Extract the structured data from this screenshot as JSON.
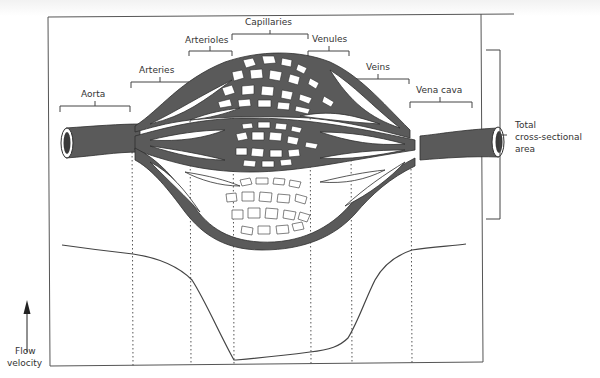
{
  "figure": {
    "segments": [
      {
        "id": "aorta",
        "label": "Aorta"
      },
      {
        "id": "arteries",
        "label": "Arteries"
      },
      {
        "id": "arterioles",
        "label": "Arterioles"
      },
      {
        "id": "capillaries",
        "label": "Capillaries"
      },
      {
        "id": "venules",
        "label": "Venules"
      },
      {
        "id": "veins",
        "label": "Veins"
      },
      {
        "id": "vena-cava",
        "label": "Vena cava"
      }
    ],
    "right_bracket": {
      "line1": "Total",
      "line2": "cross-sectional",
      "line3": "area"
    },
    "y_axis": {
      "line1": "Flow",
      "line2": "velocity",
      "arrow": "up-arrow-icon"
    },
    "colors": {
      "vessel": "#5a5a5a",
      "vessel_outline": "#2e2e2e",
      "lumen": "#ffffff",
      "line": "#444444",
      "frame": "#555555"
    }
  },
  "velocity_curve": {
    "description": "Flow velocity high in aorta, falls through arteries and arterioles, minimal in capillaries, rises through venules and veins back to high in vena cava",
    "relative_values": [
      {
        "segment": "Aorta",
        "value": 0.92
      },
      {
        "segment": "Arteries",
        "value": 0.86
      },
      {
        "segment": "Arterioles",
        "value": 0.7
      },
      {
        "segment": "Capillaries",
        "value": 0.02
      },
      {
        "segment": "Venules",
        "value": 0.1
      },
      {
        "segment": "Veins",
        "value": 0.22
      },
      {
        "segment": "Vena cava",
        "value": 0.88
      }
    ]
  }
}
